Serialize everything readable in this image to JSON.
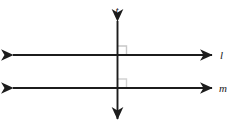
{
  "figure": {
    "background_color": "#ffffff",
    "width": 232,
    "height": 128,
    "stroke_color": "#1c1c1c",
    "right_angle_mark_color": "#c8c8c8"
  },
  "labels": {
    "transversal": "t",
    "line_upper": "l",
    "line_lower": "m"
  },
  "geometry": {
    "transversal": {
      "name": "t",
      "orientation": "vertical",
      "x": 117.5,
      "y_top": 18,
      "y_bottom": 122,
      "arrow_top": true,
      "arrow_bottom": true,
      "label_x": 117,
      "label_y": 13
    },
    "line_upper": {
      "name": "l",
      "orientation": "horizontal",
      "y": 55,
      "x_left": 10,
      "x_right": 215,
      "arrow_left": true,
      "arrow_right": true,
      "label_x": 221,
      "label_y": 59
    },
    "line_lower": {
      "name": "m",
      "orientation": "horizontal",
      "y": 88,
      "x_left": 10,
      "x_right": 215,
      "arrow_left": true,
      "arrow_right": true,
      "label_x": 220,
      "label_y": 92
    },
    "right_angle_marks": [
      {
        "at": "t-and-l",
        "x": 117.5,
        "y": 55,
        "quadrant": "upper-right",
        "size": 9
      },
      {
        "at": "t-and-m",
        "x": 117.5,
        "y": 88,
        "quadrant": "upper-right",
        "size": 9
      }
    ]
  }
}
